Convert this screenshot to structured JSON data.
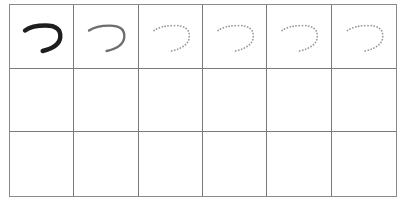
{
  "worksheet": {
    "character": "つ",
    "columns": 6,
    "rows": 3,
    "colors": {
      "grid_line": "#7a7a7a",
      "model_stroke": "#1e1e1e",
      "sample_stroke": "#6e6e6e",
      "trace_dots": "#9a9a9a"
    },
    "row1": [
      {
        "type": "model",
        "label": "solid dark model"
      },
      {
        "type": "sample",
        "label": "solid gray sample"
      },
      {
        "type": "trace",
        "label": "dotted trace"
      },
      {
        "type": "trace",
        "label": "dotted trace"
      },
      {
        "type": "trace",
        "label": "dotted trace"
      },
      {
        "type": "trace",
        "label": "dotted trace"
      }
    ]
  }
}
